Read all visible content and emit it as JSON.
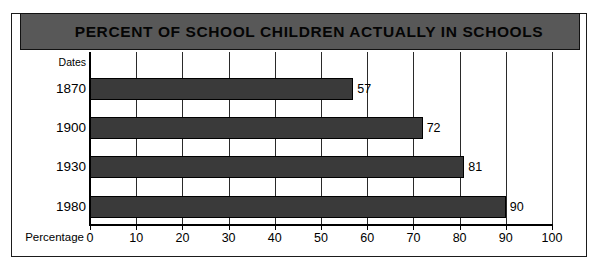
{
  "title": "PERCENT OF SCHOOL CHILDREN ACTUALLY IN SCHOOLS",
  "axes": {
    "category_header": "Dates",
    "value_axis_label": "Percentage",
    "ticks": [
      "0",
      "10",
      "20",
      "30",
      "40",
      "50",
      "60",
      "70",
      "80",
      "90",
      "100"
    ]
  },
  "colors": {
    "bar_fill": "#3a3a3a",
    "title_bar": "#585858",
    "frame": "#1b1b1b",
    "background": "#ffffff"
  },
  "chart_data": {
    "type": "bar",
    "orientation": "horizontal",
    "title": "PERCENT OF SCHOOL CHILDREN ACTUALLY IN SCHOOLS",
    "xlabel": "Percentage",
    "ylabel": "Dates",
    "categories": [
      "1870",
      "1900",
      "1930",
      "1980"
    ],
    "values": [
      57,
      72,
      81,
      90
    ],
    "value_labels": [
      "57",
      "72",
      "81",
      "90"
    ],
    "xlim": [
      0,
      100
    ],
    "xticks": [
      0,
      10,
      20,
      30,
      40,
      50,
      60,
      70,
      80,
      90,
      100
    ],
    "grid": "vertical",
    "legend": null
  }
}
